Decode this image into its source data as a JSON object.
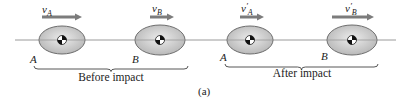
{
  "figure": {
    "caption": "(a)",
    "line_of_impact": {
      "y": 40,
      "x1": 15,
      "x2": 396
    },
    "colors": {
      "line": "#9a9a9a",
      "ellipse_fill_edge": "#b9b9b9",
      "ellipse_fill_center": "#ececec",
      "ellipse_stroke": "#6d6d6d",
      "arrow": "#7c7c7c",
      "text": "#222222"
    }
  },
  "before": {
    "label": "Before impact",
    "bodies": [
      {
        "name": "A",
        "cx": 62,
        "cy": 40,
        "rx": 23,
        "ry": 14,
        "label_x": 30,
        "label_y": 63,
        "velocity": {
          "symbol": "v",
          "sub": "A",
          "prime": "",
          "x1": 42,
          "x2": 82,
          "y": 17,
          "label_x": 42,
          "label_y": 13
        }
      },
      {
        "name": "B",
        "cx": 160,
        "cy": 40,
        "rx": 25,
        "ry": 15,
        "label_x": 132,
        "label_y": 63,
        "velocity": {
          "symbol": "v",
          "sub": "B",
          "prime": "",
          "x1": 150,
          "x2": 174,
          "y": 17,
          "label_x": 152,
          "label_y": 12
        }
      }
    ],
    "brace": {
      "x1": 34,
      "x2": 188,
      "y": 66
    },
    "label_x": 111,
    "label_y": 81
  },
  "after": {
    "label": "After impact",
    "bodies": [
      {
        "name": "A",
        "cx": 250,
        "cy": 40,
        "rx": 23,
        "ry": 14,
        "label_x": 220,
        "label_y": 61,
        "velocity": {
          "symbol": "v",
          "sub": "A",
          "prime": "′",
          "x1": 240,
          "x2": 264,
          "y": 17,
          "label_x": 241,
          "label_y": 12
        }
      },
      {
        "name": "B",
        "cx": 352,
        "cy": 40,
        "rx": 25,
        "ry": 15,
        "label_x": 321,
        "label_y": 60,
        "velocity": {
          "symbol": "v",
          "sub": "B",
          "prime": "′",
          "x1": 332,
          "x2": 374,
          "y": 17,
          "label_x": 345,
          "label_y": 12
        }
      }
    ],
    "brace": {
      "x1": 225,
      "x2": 378,
      "y": 64
    },
    "label_x": 302,
    "label_y": 77
  },
  "caption_pos": {
    "x": 198,
    "y": 95
  }
}
